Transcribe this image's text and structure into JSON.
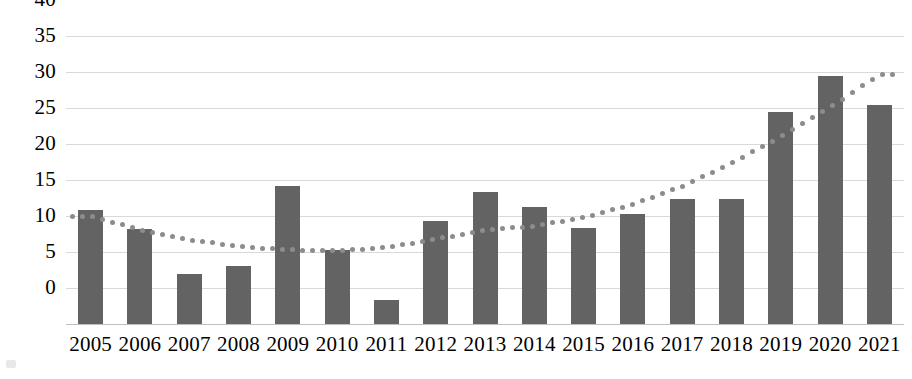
{
  "chart_data": {
    "type": "bar",
    "title": "",
    "subtitle": "",
    "xlabel": "",
    "ylabel": "",
    "categories": [
      "2005",
      "2006",
      "2007",
      "2008",
      "2009",
      "2010",
      "2011",
      "2012",
      "2013",
      "2014",
      "2015",
      "2016",
      "2017",
      "2018",
      "2019",
      "2020",
      "2021"
    ],
    "values": [
      15.9,
      13.2,
      7.0,
      8.1,
      19.2,
      10.3,
      3.3,
      14.3,
      18.3,
      16.2,
      13.4,
      15.3,
      17.4,
      17.4,
      29.4,
      34.5,
      30.4
    ],
    "series": [
      {
        "name": "Bars",
        "type": "bar",
        "color": "#636363",
        "values": [
          15.9,
          13.2,
          7.0,
          8.1,
          19.2,
          10.3,
          3.3,
          14.3,
          18.3,
          16.2,
          13.4,
          15.3,
          17.4,
          17.4,
          29.4,
          34.5,
          30.4
        ]
      },
      {
        "name": "Trendline",
        "type": "line",
        "style": "dotted",
        "color": "#8c8c8c",
        "values": [
          15.0,
          13.1,
          11.7,
          10.8,
          10.3,
          10.2,
          10.6,
          11.8,
          13.0,
          13.6,
          14.8,
          16.6,
          19.1,
          22.3,
          26.0,
          30.1,
          34.6
        ]
      }
    ],
    "ylim": [
      0,
      40
    ],
    "ytick_values": [
      0,
      5,
      10,
      15,
      20,
      25,
      30,
      35,
      40
    ],
    "ytick_labels": [
      "0",
      "5",
      "10",
      "15",
      "20",
      "25",
      "30",
      "35",
      "40"
    ],
    "grid": true,
    "grid_color": "#d9d9d9",
    "legend": "none",
    "legend_position": "none",
    "annotations": [],
    "background": "#ffffff"
  }
}
